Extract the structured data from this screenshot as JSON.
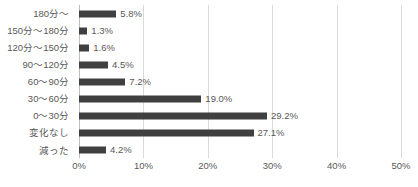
{
  "chart_data": {
    "type": "bar",
    "orientation": "horizontal",
    "title": "",
    "subtitle": "",
    "xlabel": "",
    "ylabel": "",
    "xlim": [
      0,
      50
    ],
    "grid": true,
    "legend": false,
    "legend_position": "none",
    "xticks": [
      "0%",
      "10%",
      "20%",
      "30%",
      "40%",
      "50%"
    ],
    "xtick_values": [
      0,
      10,
      20,
      30,
      40,
      50
    ],
    "categories": [
      "180分～",
      "150分～180分",
      "120分～150分",
      "90～120分",
      "60～90分",
      "30～60分",
      "0～30分",
      "変化なし",
      "減った"
    ],
    "values": [
      5.8,
      1.3,
      1.6,
      4.5,
      7.2,
      19.0,
      29.2,
      27.1,
      4.2
    ],
    "data_labels": [
      "5.8%",
      "1.3%",
      "1.6%",
      "4.5%",
      "7.2%",
      "19.0%",
      "29.2%",
      "27.1%",
      "4.2%"
    ],
    "colors": {
      "bar": "#404040",
      "text": "#595959",
      "gridline": "#d9d9d9",
      "axis": "#bfbfbf",
      "background": "#ffffff"
    }
  }
}
